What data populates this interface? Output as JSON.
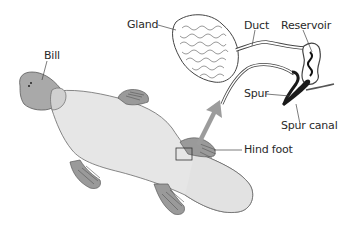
{
  "diagram": {
    "labels": {
      "bill": "Bill",
      "gland": "Gland",
      "duct": "Duct",
      "reservoir": "Reservoir",
      "spur": "Spur",
      "spur_canal": "Spur canal",
      "hind_foot": "Hind foot"
    },
    "colors": {
      "body": "#e6e6e6",
      "bill": "#a9a9a9",
      "foot": "#9a9a9a",
      "outline": "#5a5a5a",
      "arrow": "#9c9c9c",
      "text": "#2a2a2a",
      "spur_dark": "#1a1a1a"
    }
  }
}
